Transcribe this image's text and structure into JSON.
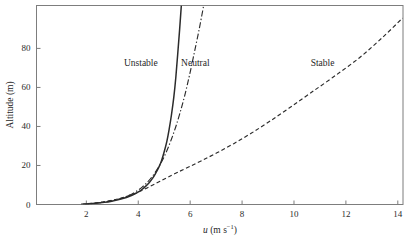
{
  "chart_data": {
    "type": "line",
    "title": "",
    "subtitle": "",
    "xlabel": "u (m s^-1)",
    "xlabel_parts": {
      "symbol": "u",
      "unit_prefix": " (m s",
      "unit_exponent": "−1",
      "unit_suffix": ")"
    },
    "ylabel": "Altitude (m)",
    "xlim": [
      0.08,
      14.2
    ],
    "ylim": [
      0,
      102
    ],
    "xticks": [
      2,
      4,
      6,
      8,
      10,
      12,
      14
    ],
    "yticks": [
      0,
      20,
      40,
      60,
      80
    ],
    "xticklabels": [
      "2",
      "4",
      "6",
      "8",
      "10",
      "12",
      "14"
    ],
    "yticklabels": [
      "0",
      "20",
      "40",
      "60",
      "80"
    ],
    "grid": false,
    "legend": "inline-annotations",
    "axis_color": "#7d7d7d",
    "line_color": "#2b2b2b",
    "background": "#ffffff",
    "series": [
      {
        "name": "Unstable",
        "style": "solid",
        "label_x": 4.1,
        "label_y": 72,
        "x": [
          1.95,
          2.35,
          2.7,
          2.98,
          3.22,
          3.44,
          3.64,
          3.82,
          3.99,
          4.14,
          4.28,
          4.42,
          4.55,
          4.67,
          4.79,
          4.9,
          5.0,
          5.1,
          5.19,
          5.28,
          5.37,
          5.45,
          5.52,
          5.59,
          5.66
        ],
        "y": [
          0.2,
          0.6,
          1.1,
          1.7,
          2.4,
          3.2,
          4.1,
          5.1,
          6.3,
          7.7,
          9.3,
          11.2,
          13.4,
          16.0,
          19.0,
          22.6,
          27.0,
          32.2,
          38.5,
          46.0,
          55.0,
          65.5,
          77.0,
          89.0,
          102.0
        ]
      },
      {
        "name": "Neutral",
        "style": "dashdot",
        "label_x": 6.2,
        "label_y": 72,
        "x": [
          1.88,
          2.22,
          2.52,
          2.78,
          3.02,
          3.24,
          3.44,
          3.63,
          3.81,
          3.98,
          4.15,
          4.31,
          4.47,
          4.63,
          4.79,
          4.95,
          5.11,
          5.27,
          5.44,
          5.61,
          5.79,
          5.97,
          6.16,
          6.35,
          6.52
        ],
        "y": [
          0.2,
          0.5,
          0.9,
          1.4,
          2.0,
          2.7,
          3.6,
          4.6,
          5.8,
          7.2,
          8.9,
          10.9,
          13.2,
          16.0,
          19.3,
          23.2,
          27.8,
          33.2,
          39.6,
          47.0,
          55.8,
          66.0,
          77.8,
          90.0,
          102.0
        ]
      },
      {
        "name": "Stable",
        "style": "dashed",
        "label_x": 11.1,
        "label_y": 72,
        "x": [
          1.8,
          2.25,
          2.62,
          2.93,
          3.2,
          3.45,
          3.68,
          3.9,
          4.12,
          4.34,
          4.58,
          4.84,
          5.14,
          5.5,
          5.94,
          6.46,
          7.05,
          7.68,
          8.35,
          9.05,
          9.8,
          10.6,
          11.5,
          12.5,
          13.4,
          14.18
        ],
        "y": [
          0.2,
          0.7,
          1.3,
          2.0,
          2.8,
          3.7,
          4.7,
          5.8,
          7.1,
          8.5,
          10.1,
          11.9,
          14.0,
          16.4,
          19.2,
          22.6,
          26.6,
          31.2,
          36.5,
          42.5,
          49.3,
          56.8,
          65.2,
          75.0,
          85.5,
          95.5
        ]
      }
    ]
  }
}
